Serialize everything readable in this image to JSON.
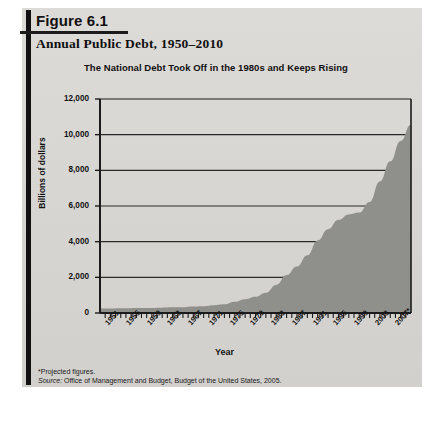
{
  "figure": {
    "number": "Figure 6.1",
    "title": "Annual Public Debt, 1950–2010",
    "subtitle": "The National Debt Took Off in the 1980s and Keeps Rising",
    "footnote_projected": "*Projected figures.",
    "source_prefix": "Source:",
    "source_text": "Office of Management and Budget, Budget of the United States, 2005."
  },
  "colors": {
    "page_background": "#d9d9d7",
    "area_fill": "#8f8f8c",
    "axis_line": "#1b1b1b",
    "grid_line": "#2a2a2a",
    "rule": "#111111",
    "text": "#111111"
  },
  "chart_data": {
    "type": "area",
    "title": "Annual Public Debt, 1950–2010",
    "subtitle": "The National Debt Took Off in the 1980s and Keeps Rising",
    "xlabel": "Year",
    "ylabel": "Billions of dollars",
    "ylim": [
      0,
      12000
    ],
    "yticks": [
      0,
      2000,
      4000,
      6000,
      8000,
      10000,
      12000
    ],
    "ytick_labels": [
      "0",
      "2,000",
      "4,000",
      "6,000",
      "8,000",
      "10,000",
      "12,000"
    ],
    "xlim": [
      1950,
      2010
    ],
    "xtick_labels": [
      "1951",
      "1955",
      "1959",
      "1963",
      "1967",
      "1971",
      "1975",
      "1979",
      "1983",
      "1987",
      "1991",
      "1995",
      "1999",
      "2003",
      "2007*"
    ],
    "xticks": [
      1951,
      1955,
      1959,
      1963,
      1967,
      1971,
      1975,
      1979,
      1983,
      1987,
      1991,
      1995,
      1999,
      2003,
      2007
    ],
    "grid": true,
    "legend": "none",
    "series_name": "Public debt",
    "x": [
      1950,
      1952,
      1954,
      1956,
      1958,
      1960,
      1962,
      1964,
      1966,
      1968,
      1970,
      1972,
      1974,
      1976,
      1978,
      1980,
      1982,
      1984,
      1986,
      1988,
      1990,
      1992,
      1994,
      1996,
      1998,
      2000,
      2002,
      2004,
      2006,
      2008,
      2010
    ],
    "values": [
      257,
      259,
      271,
      273,
      276,
      286,
      298,
      317,
      329,
      369,
      381,
      436,
      486,
      629,
      772,
      909,
      1142,
      1577,
      2125,
      2602,
      3233,
      4065,
      4693,
      5225,
      5526,
      5629,
      6228,
      7379,
      8507,
      9650,
      10560
    ]
  }
}
